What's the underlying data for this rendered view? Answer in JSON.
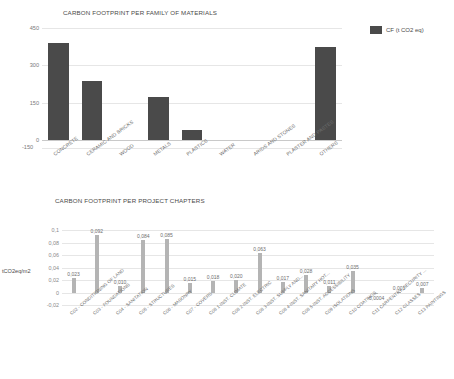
{
  "chart_data": [
    {
      "type": "bar",
      "title": "CARBON FOOTPRINT PER FAMILY OF MATERIALS",
      "xlabel": "",
      "ylabel": "",
      "ylim": [
        -150,
        450
      ],
      "yticks": [
        "450",
        "300",
        "150",
        "0",
        "-150"
      ],
      "grid": true,
      "legend": {
        "position": "right",
        "entries": [
          "CF  (t CO2 eq)"
        ]
      },
      "series_color": "#4a4a4a",
      "categories": [
        "CONCRETE",
        "CERAMIC AND BRICKS",
        "WOOD",
        "METALS",
        "PLASTICS",
        "WATER",
        "ARIDS AND STONES",
        "PLASTER AND PASTES",
        "OTHERS"
      ],
      "values": [
        390,
        237,
        -6,
        172,
        40,
        0,
        -4,
        0,
        374
      ]
    },
    {
      "type": "bar",
      "title": "CARBON FOOTPRINT PER PROJECT CHAPTERS",
      "xlabel": "",
      "ylabel": "tCO2eq/m2",
      "ylim": [
        -0.02,
        0.1
      ],
      "yticks": [
        "0,1",
        "0,08",
        "0,06",
        "0,04",
        "0,02",
        "0",
        "-0,02"
      ],
      "grid": true,
      "series_color": "#b4b4b4",
      "categories": [
        "C02 - CONDITIONING OF LAND",
        "C03 - FOUNDATIONS",
        "C04 - SANITATION",
        "C05 - STRUCTURES",
        "C06 - MASONRY",
        "C07 - COVERS",
        "C08 1-INST. CLIMATE",
        "C08 2-INST. ELECTRIC",
        "C08 3-INST. SUPPLY AND...",
        "C08 4-INST. SANITARY HOT...",
        "C08 5-INST. ACCESSIBILITY",
        "C09 ISOLATIONS",
        "C10 COATINGS",
        "C11 CARPENTRY, SECURITY ...",
        "C12 GLASSES",
        "C13 PAINTINGS"
      ],
      "values": [
        0.023,
        0.092,
        0.01,
        0.084,
        0.085,
        0.015,
        0.018,
        0.02,
        0.063,
        0.017,
        0.028,
        0.011,
        0.035,
        -0.0004,
        0.001,
        0.007
      ],
      "value_labels": [
        "0,023",
        "0,092",
        "0,010",
        "0,084",
        "0,085",
        "0,015",
        "0,018",
        "0,020",
        "0,063",
        "0,017",
        "0,028",
        "0,011",
        "0,035",
        "-0,0004",
        "0,001",
        "0,007"
      ]
    }
  ]
}
